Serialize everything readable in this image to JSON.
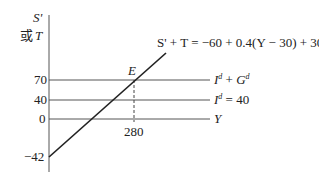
{
  "diagram": {
    "y_axis_label_line1": "S'",
    "y_axis_label_line2_prefix": "或",
    "y_axis_label_line2_var": "T",
    "x_axis_label": "Y",
    "equilibrium_label": "E",
    "equation_label": "S' + T = −60 + 0.4(Y − 30) + 30",
    "curves": [
      {
        "id": "id_gd",
        "label_base": "I",
        "label_sup": "d",
        "label_plus": " + ",
        "label_base2": "G",
        "label_sup2": "d",
        "label_suffix": "",
        "value": 70
      },
      {
        "id": "id",
        "label_base": "I",
        "label_sup": "d",
        "label_suffix": " = 40",
        "value": 40
      },
      {
        "id": "y_axis_zero",
        "value": 0
      }
    ],
    "y_ticks": [
      "70",
      "40",
      "0",
      "−42"
    ],
    "x_ticks": [
      "280"
    ],
    "colors": {
      "line": "#222222",
      "axis": "#555555"
    }
  }
}
